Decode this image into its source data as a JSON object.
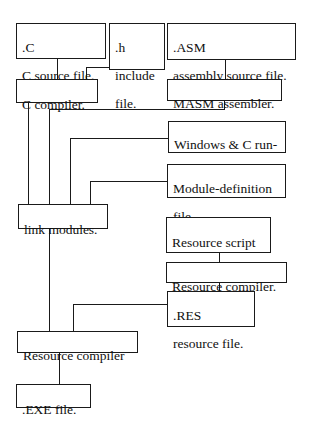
{
  "diagram": {
    "type": "build-process flowchart",
    "nodes": {
      "c_source": {
        "lines": [
          ".C",
          "C source file."
        ]
      },
      "h_include": {
        "lines": [
          ".h",
          "include",
          "file."
        ]
      },
      "asm_source": {
        "lines": [
          ".ASM",
          "assembly source file."
        ]
      },
      "c_compiler": {
        "lines": [
          "C compiler."
        ]
      },
      "masm_assembler": {
        "lines": [
          "MASM assembler."
        ]
      },
      "runtime_libs": {
        "lines": [
          "Windows & C run-",
          "time libraries."
        ]
      },
      "module_def": {
        "lines": [
          "Module-definition",
          "file."
        ]
      },
      "link_modules": {
        "lines": [
          "link modules."
        ]
      },
      "resource_script": {
        "lines": [
          "Resource script",
          "files."
        ]
      },
      "resource_compiler_1": {
        "lines": [
          "Resource compiler."
        ]
      },
      "res_file": {
        "lines": [
          ".RES",
          "resource file."
        ]
      },
      "resource_compiler_2": {
        "lines": [
          "Resource compiler"
        ]
      },
      "exe_file": {
        "lines": [
          ".EXE file."
        ]
      }
    },
    "edges": [
      [
        "c_source",
        "c_compiler"
      ],
      [
        "h_include",
        "c_compiler"
      ],
      [
        "asm_source",
        "masm_assembler"
      ],
      [
        "c_compiler",
        "link_modules"
      ],
      [
        "masm_assembler",
        "link_modules"
      ],
      [
        "runtime_libs",
        "link_modules"
      ],
      [
        "module_def",
        "link_modules"
      ],
      [
        "resource_script",
        "resource_compiler_1"
      ],
      [
        "resource_compiler_1",
        "res_file"
      ],
      [
        "link_modules",
        "resource_compiler_2"
      ],
      [
        "res_file",
        "resource_compiler_2"
      ],
      [
        "resource_compiler_2",
        "exe_file"
      ]
    ]
  }
}
